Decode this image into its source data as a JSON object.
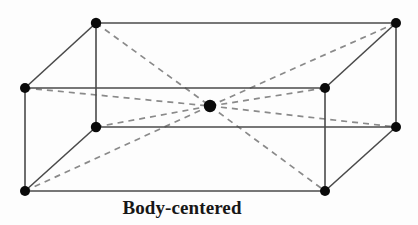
{
  "figure": {
    "caption": "Body-centered",
    "type": "crystal-lattice-unit-cell",
    "canvas": {
      "width": 418,
      "height": 225,
      "background": "#fdfdfd"
    },
    "style": {
      "solid_edge_color": "#4a4a4a",
      "solid_edge_width": 1.6,
      "dashed_line_color": "#8a8a8a",
      "dashed_line_width": 1.7,
      "dash_pattern": "6 5",
      "vertex_color": "#0a0a0a",
      "vertex_radius": 5.0,
      "center_atom_color": "#0a0a0a",
      "center_atom_radius": 6.2,
      "caption_color": "#171717"
    },
    "vertices": [
      {
        "name": "front-top-left",
        "id": "FTL",
        "x": 25,
        "y": 88,
        "r": 5.0
      },
      {
        "name": "front-top-right",
        "id": "FTR",
        "x": 325,
        "y": 88,
        "r": 5.0
      },
      {
        "name": "front-bottom-right",
        "id": "FBR",
        "x": 325,
        "y": 191,
        "r": 5.0
      },
      {
        "name": "front-bottom-left",
        "id": "FBL",
        "x": 25,
        "y": 191,
        "r": 5.0
      },
      {
        "name": "back-top-left",
        "id": "BTL",
        "x": 96,
        "y": 23,
        "r": 5.2
      },
      {
        "name": "back-top-right",
        "id": "BTR",
        "x": 396,
        "y": 23,
        "r": 5.0
      },
      {
        "name": "back-bottom-right",
        "id": "BBR",
        "x": 396,
        "y": 127,
        "r": 5.0
      },
      {
        "name": "back-bottom-left",
        "id": "BBL",
        "x": 96,
        "y": 127,
        "r": 5.2
      }
    ],
    "center_atom": {
      "name": "body-center-atom",
      "x": 210,
      "y": 106,
      "r": 6.2
    },
    "solid_edges": [
      {
        "name": "edge-front-top",
        "x1": 25,
        "y1": 88,
        "x2": 325,
        "y2": 88
      },
      {
        "name": "edge-front-right",
        "x1": 325,
        "y1": 88,
        "x2": 325,
        "y2": 191
      },
      {
        "name": "edge-front-bottom",
        "x1": 325,
        "y1": 191,
        "x2": 25,
        "y2": 191
      },
      {
        "name": "edge-front-left",
        "x1": 25,
        "y1": 191,
        "x2": 25,
        "y2": 88
      },
      {
        "name": "edge-back-top",
        "x1": 96,
        "y1": 23,
        "x2": 396,
        "y2": 23
      },
      {
        "name": "edge-back-right",
        "x1": 396,
        "y1": 23,
        "x2": 396,
        "y2": 127
      },
      {
        "name": "edge-back-bottom",
        "x1": 396,
        "y1": 127,
        "x2": 96,
        "y2": 127
      },
      {
        "name": "edge-back-left",
        "x1": 96,
        "y1": 127,
        "x2": 96,
        "y2": 23
      },
      {
        "name": "edge-depth-top-left",
        "x1": 25,
        "y1": 88,
        "x2": 96,
        "y2": 23
      },
      {
        "name": "edge-depth-top-right",
        "x1": 325,
        "y1": 88,
        "x2": 396,
        "y2": 23
      },
      {
        "name": "edge-depth-bot-right",
        "x1": 325,
        "y1": 191,
        "x2": 396,
        "y2": 127
      },
      {
        "name": "edge-depth-bot-left",
        "x1": 25,
        "y1": 191,
        "x2": 96,
        "y2": 127
      }
    ],
    "dashed_diagonals": [
      {
        "name": "diagonal-btl-to-center",
        "x1": 96,
        "y1": 23,
        "x2": 210,
        "y2": 106
      },
      {
        "name": "diagonal-center-to-fbr",
        "x1": 210,
        "y1": 106,
        "x2": 325,
        "y2": 191
      },
      {
        "name": "diagonal-btr-to-center",
        "x1": 396,
        "y1": 23,
        "x2": 210,
        "y2": 106
      },
      {
        "name": "diagonal-center-to-fbl",
        "x1": 210,
        "y1": 106,
        "x2": 25,
        "y2": 191
      },
      {
        "name": "diagonal-ftl-to-center",
        "x1": 25,
        "y1": 88,
        "x2": 210,
        "y2": 106
      },
      {
        "name": "diagonal-center-to-bbr",
        "x1": 210,
        "y1": 106,
        "x2": 396,
        "y2": 127
      },
      {
        "name": "diagonal-ftr-to-center",
        "x1": 325,
        "y1": 88,
        "x2": 210,
        "y2": 106
      },
      {
        "name": "diagonal-center-to-bbl",
        "x1": 210,
        "y1": 106,
        "x2": 96,
        "y2": 127
      }
    ]
  }
}
